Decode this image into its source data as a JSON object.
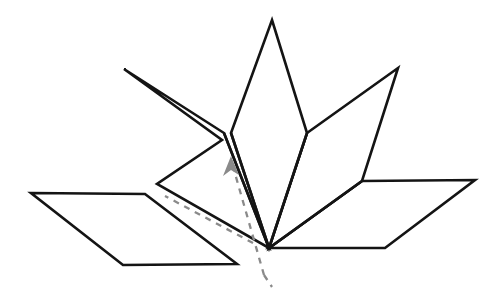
{
  "figure": {
    "background_color": "#ffffff",
    "stroke_color": "#141414",
    "dashed_color": "#8a8a8a",
    "stroke_width": 2.6,
    "canvas": {
      "width": 496,
      "height": 293
    },
    "base_vertex": {
      "x": 269,
      "y": 248
    },
    "shapes": [
      {
        "name": "left-flat-petal",
        "label": "Left horizontal petal",
        "points": "31,193 145,194 237,264 123,265",
        "kind": "parallelogram"
      },
      {
        "name": "left-raised-petal",
        "label": "Left raised petal",
        "points": "124,69 222,140 157,184 269,248 224,133",
        "kind": "folded-petal"
      },
      {
        "name": "center-petal",
        "label": "Center vertical petal",
        "points": "272,20 307,133 269,248 231,133",
        "kind": "kite"
      },
      {
        "name": "right-raised-petal",
        "label": "Right raised petal",
        "points": "398,68 362,181 269,248 307,133",
        "kind": "folded-petal"
      },
      {
        "name": "right-flat-petal",
        "label": "Right horizontal petal",
        "points": "362,181 475,180 385,248 269,248",
        "kind": "parallelogram"
      }
    ],
    "fold_lines": [
      {
        "name": "left-petal-crease",
        "path": "M 224,133 L 269,248"
      },
      {
        "name": "center-left-crease",
        "path": "M 231,133 L 269,248"
      },
      {
        "name": "center-right-crease",
        "path": "M 307,133 L 269,248"
      },
      {
        "name": "right-petal-crease",
        "path": "M 362,181 L 269,248"
      }
    ],
    "axis": {
      "name": "symmetry-axis",
      "style": "dashed",
      "color": "#8a8a8a",
      "dash_pattern": "6 6",
      "upper_segment": "M 264,275 L 232,163",
      "lower_segment": "M 264,275 L 272,287",
      "secondary_segment": "M 253,243 L 165,196",
      "arrow_direction": "up",
      "arrow_tip": {
        "x": 231,
        "y": 157
      }
    }
  }
}
